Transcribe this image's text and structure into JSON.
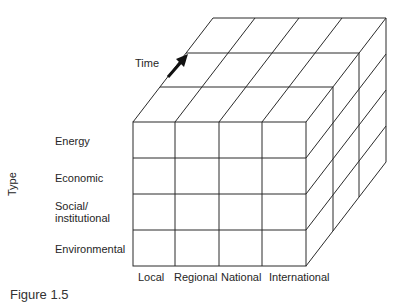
{
  "diagram": {
    "type": "3d-matrix-cube",
    "depth_axis_label": "Time",
    "vertical_axis_label": "Type",
    "rows": [
      "Energy",
      "Economic",
      "Social/\ninstitutional",
      "Environmental"
    ],
    "row_labels": {
      "energy": "Energy",
      "economic": "Economic",
      "social_line1": "Social/",
      "social_line2": "institutional",
      "environmental": "Environmental"
    },
    "columns": [
      "Local",
      "Regional",
      "National",
      "International"
    ],
    "column_labels": {
      "local": "Local",
      "regional": "Regional",
      "national": "National",
      "international": "International"
    },
    "depth_slices": 3,
    "line_color": "#2a2a2a",
    "caption": "Figure 1.5"
  }
}
